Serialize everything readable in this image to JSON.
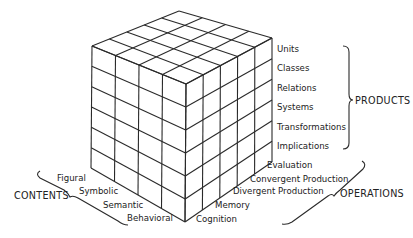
{
  "diagram": {
    "dimensions": {
      "products": {
        "label": "PRODUCTS",
        "items": [
          "Units",
          "Classes",
          "Relations",
          "Systems",
          "Transformations",
          "Implications"
        ]
      },
      "operations": {
        "label": "OPERATIONS",
        "items": [
          "Evaluation",
          "Convergent Production",
          "Divergent Production",
          "Memory",
          "Cognition"
        ]
      },
      "contents": {
        "label": "CONTENTS",
        "items": [
          "Figural",
          "Symbolic",
          "Semantic",
          "Behavioral"
        ]
      }
    },
    "colors": {
      "line": "#2a2a2a",
      "background": "#ffffff"
    }
  }
}
